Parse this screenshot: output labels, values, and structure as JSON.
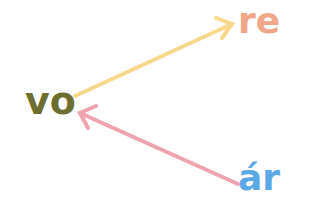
{
  "words": {
    "vo": {
      "text": "vo",
      "color": "#6e6e30"
    },
    "re": {
      "text": "re",
      "color": "#f2a688"
    },
    "ar": {
      "text": "ár",
      "color": "#5aa9e6"
    }
  },
  "arrows": [
    {
      "from": "vo",
      "to": "re",
      "color": "#f8d98c"
    },
    {
      "from": "ár",
      "to": "vo",
      "color": "#eea3ad"
    }
  ]
}
